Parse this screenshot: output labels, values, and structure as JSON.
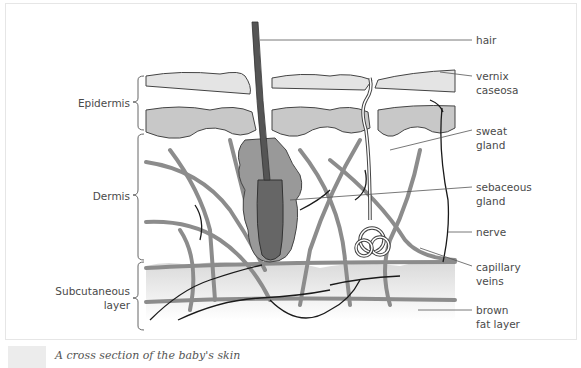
{
  "figure": {
    "caption": "A cross section of the baby's skin",
    "layers": [
      {
        "name": "Epidermis"
      },
      {
        "name": "Dermis"
      },
      {
        "name": "Subcutaneous layer",
        "lines": [
          "Subcutaneous",
          "layer"
        ]
      }
    ],
    "annotations": [
      {
        "id": "hair",
        "lines": [
          "hair"
        ]
      },
      {
        "id": "vernix",
        "lines": [
          "vernix",
          "caseosa"
        ]
      },
      {
        "id": "sweat",
        "lines": [
          "sweat",
          "gland"
        ]
      },
      {
        "id": "sebaceous",
        "lines": [
          "sebaceous",
          "gland"
        ]
      },
      {
        "id": "nerve",
        "lines": [
          "nerve"
        ]
      },
      {
        "id": "capillary",
        "lines": [
          "capillary",
          "veins"
        ]
      },
      {
        "id": "fat",
        "lines": [
          "brown",
          "fat layer"
        ]
      }
    ],
    "colors": {
      "epidermis_fill": "#c8c8c8",
      "vessel": "#8c8c8c",
      "nerve": "#1a1a1a",
      "hair": "#555555",
      "subcutaneous_fill": "#e2e2e2",
      "label_text": "#4a4a4a"
    }
  }
}
